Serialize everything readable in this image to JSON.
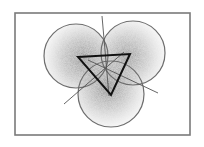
{
  "figure": {
    "colors": {
      "background": "#ffffff",
      "frame": "#7a7a7a",
      "circle_stroke": "#6e6e6e",
      "shading_dark": "#6a6a6a",
      "shading_light": "#d8d8d8",
      "triangle": "#111111",
      "thin_line": "#555555"
    },
    "frame": {
      "x": 15,
      "y": 13,
      "width": 175,
      "height": 122
    },
    "circles": [
      {
        "name": "top-left",
        "cx": 76,
        "cy": 56,
        "r": 32
      },
      {
        "name": "top-right",
        "cx": 133,
        "cy": 53,
        "r": 32
      },
      {
        "name": "bottom",
        "cx": 111,
        "cy": 94,
        "r": 33
      }
    ],
    "triangle": {
      "points": [
        [
          78,
          57
        ],
        [
          130,
          54
        ],
        [
          111,
          95
        ]
      ]
    },
    "lines": [
      {
        "name": "vertical-bisector",
        "x1": 102,
        "y1": 16,
        "x2": 109,
        "y2": 96
      },
      {
        "name": "left-diagonal",
        "x1": 64,
        "y1": 104,
        "x2": 124,
        "y2": 52
      },
      {
        "name": "right-diagonal",
        "x1": 88,
        "y1": 60,
        "x2": 158,
        "y2": 93
      }
    ]
  }
}
